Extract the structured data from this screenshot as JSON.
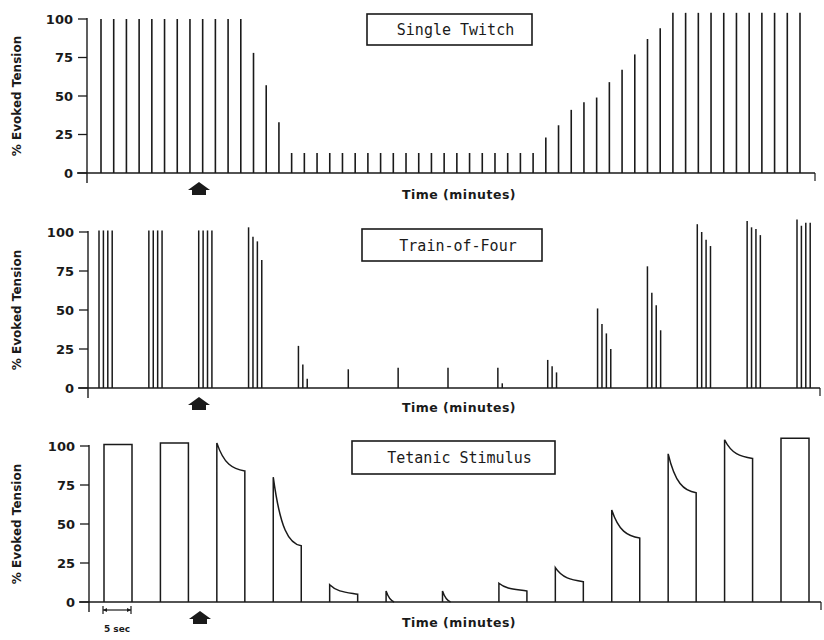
{
  "chart_data": [
    {
      "type": "bar",
      "title": "Single Twitch",
      "xlabel": "Time (minutes)",
      "ylabel": "% Evoked Tension",
      "ylim": [
        0,
        100
      ],
      "yticks": [
        0,
        25,
        50,
        75,
        100
      ],
      "marker": "arrow at drug administration (~8th stimulus)",
      "values": [
        100,
        100,
        100,
        100,
        100,
        100,
        100,
        100,
        100,
        100,
        100,
        100,
        78,
        57,
        33,
        13,
        13,
        13,
        13,
        13,
        13,
        13,
        13,
        13,
        13,
        13,
        13,
        13,
        13,
        13,
        13,
        13,
        13,
        13,
        13,
        23,
        31,
        41,
        46,
        49,
        59,
        67,
        77,
        87,
        94,
        104,
        104,
        104,
        104,
        104,
        104,
        104,
        104,
        104,
        104,
        104
      ]
    },
    {
      "type": "bar",
      "title": "Train-of-Four",
      "xlabel": "Time (minutes)",
      "ylabel": "% Evoked Tension",
      "ylim": [
        0,
        100
      ],
      "yticks": [
        0,
        25,
        50,
        75,
        100
      ],
      "marker": "arrow at drug administration (3rd train)",
      "series": [
        {
          "name": "train 1",
          "values": [
            101,
            101,
            101,
            101
          ]
        },
        {
          "name": "train 2",
          "values": [
            101,
            101,
            101,
            101
          ]
        },
        {
          "name": "train 3",
          "values": [
            101,
            101,
            101,
            101
          ]
        },
        {
          "name": "train 4",
          "values": [
            103,
            97,
            94,
            82
          ]
        },
        {
          "name": "train 5",
          "values": [
            27,
            15,
            6,
            0
          ]
        },
        {
          "name": "train 6",
          "values": [
            12,
            0,
            0,
            0
          ]
        },
        {
          "name": "train 7",
          "values": [
            13,
            0,
            0,
            0
          ]
        },
        {
          "name": "train 8",
          "values": [
            13,
            0,
            0,
            0
          ]
        },
        {
          "name": "train 9",
          "values": [
            13,
            3,
            0,
            0
          ]
        },
        {
          "name": "train 10",
          "values": [
            18,
            14,
            10,
            0
          ]
        },
        {
          "name": "train 11",
          "values": [
            51,
            41,
            35,
            25
          ]
        },
        {
          "name": "train 12",
          "values": [
            78,
            61,
            53,
            37
          ]
        },
        {
          "name": "train 13",
          "values": [
            105,
            100,
            95,
            91
          ]
        },
        {
          "name": "train 14",
          "values": [
            107,
            103,
            102,
            98
          ]
        },
        {
          "name": "train 15",
          "values": [
            108,
            104,
            106,
            106
          ]
        }
      ]
    },
    {
      "type": "line",
      "title": "Tetanic Stimulus",
      "xlabel": "Time (minutes)",
      "ylabel": "% Evoked Tension",
      "ylim": [
        0,
        100
      ],
      "yticks": [
        0,
        25,
        50,
        75,
        100
      ],
      "scale_bar": "5 sec",
      "marker": "arrow at drug administration",
      "series": [
        {
          "name": "tetanus 1",
          "peak": 101,
          "end": 101
        },
        {
          "name": "tetanus 2",
          "peak": 102,
          "end": 102
        },
        {
          "name": "tetanus 3",
          "peak": 102,
          "end": 84
        },
        {
          "name": "tetanus 4",
          "peak": 80,
          "end": 36
        },
        {
          "name": "tetanus 5",
          "peak": 11,
          "end": 5
        },
        {
          "name": "tetanus 6",
          "peak": 7,
          "end": 0
        },
        {
          "name": "tetanus 7",
          "peak": 7,
          "end": 0
        },
        {
          "name": "tetanus 8",
          "peak": 12,
          "end": 7
        },
        {
          "name": "tetanus 9",
          "peak": 22,
          "end": 13
        },
        {
          "name": "tetanus 10",
          "peak": 59,
          "end": 41
        },
        {
          "name": "tetanus 11",
          "peak": 95,
          "end": 70
        },
        {
          "name": "tetanus 12",
          "peak": 104,
          "end": 92
        },
        {
          "name": "tetanus 13",
          "peak": 105,
          "end": 105
        }
      ]
    }
  ],
  "labels": {
    "ylabel": "% Evoked Tension",
    "xlabel": "Time (minutes)",
    "panel1_title": "Single Twitch",
    "panel2_title": "Train-of-Four",
    "panel3_title": "Tetanic Stimulus",
    "scale_bar": "5 sec",
    "yticks": [
      "100",
      "75",
      "50",
      "25",
      "0"
    ]
  }
}
